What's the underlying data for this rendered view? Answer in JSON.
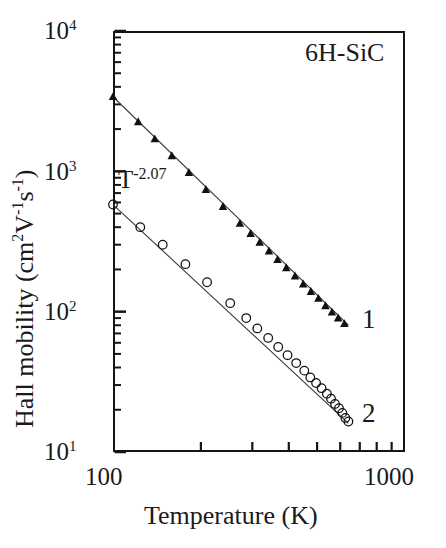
{
  "figure": {
    "sample_label": "6H-SiC",
    "annotation": {
      "base": "T",
      "exponent": "-2.07"
    }
  },
  "axes": {
    "x_title": "Temperature (K)",
    "y_title_main": "Hall mobility (cm",
    "y_title_sup1": "2",
    "y_title_mid": "V",
    "y_title_sup2": "-1",
    "y_title_mid2": "s",
    "y_title_sup3": "-1",
    "y_title_close": ")",
    "x_ticks": [
      "100",
      "1000"
    ],
    "y_ticks": [
      {
        "mantissa": "10",
        "exponent": "4"
      },
      {
        "mantissa": "10",
        "exponent": "3"
      },
      {
        "mantissa": "10",
        "exponent": "2"
      },
      {
        "mantissa": "10",
        "exponent": "1"
      }
    ]
  },
  "series_labels": {
    "one": "1",
    "two": "2"
  },
  "chart_data": {
    "type": "scatter",
    "title": "",
    "subtitle": "",
    "annotation": "T-2.07",
    "sample": "6H-SiC",
    "xlabel": "Temperature (K)",
    "ylabel": "Hall mobility (cm2V-1s-1)",
    "xscale": "log",
    "yscale": "log",
    "xlim": [
      100,
      1000
    ],
    "ylim": [
      10,
      10000
    ],
    "xticks": [
      100,
      1000
    ],
    "xminorticks": [
      200,
      300,
      400,
      500,
      600,
      700,
      800,
      900
    ],
    "yticks": [
      10,
      100,
      1000,
      10000
    ],
    "grid": false,
    "legend": "inline-labels",
    "series": [
      {
        "name": "1",
        "marker": "filled-triangle",
        "color": "#111111",
        "fit_line": {
          "slope": -2.07,
          "x": [
            100,
            640
          ],
          "y": [
            3400,
            80
          ]
        },
        "points": [
          {
            "x": 100,
            "y": 3400
          },
          {
            "x": 122,
            "y": 2250
          },
          {
            "x": 139,
            "y": 1700
          },
          {
            "x": 159,
            "y": 1290
          },
          {
            "x": 182,
            "y": 980
          },
          {
            "x": 208,
            "y": 740
          },
          {
            "x": 238,
            "y": 560
          },
          {
            "x": 272,
            "y": 425
          },
          {
            "x": 296,
            "y": 360
          },
          {
            "x": 318,
            "y": 312
          },
          {
            "x": 342,
            "y": 270
          },
          {
            "x": 366,
            "y": 235
          },
          {
            "x": 392,
            "y": 205
          },
          {
            "x": 420,
            "y": 179
          },
          {
            "x": 448,
            "y": 157
          },
          {
            "x": 476,
            "y": 139
          },
          {
            "x": 505,
            "y": 124
          },
          {
            "x": 534,
            "y": 110
          },
          {
            "x": 562,
            "y": 99
          },
          {
            "x": 590,
            "y": 90
          },
          {
            "x": 620,
            "y": 82
          }
        ]
      },
      {
        "name": "2",
        "marker": "open-circle",
        "color": "#111111",
        "fit_line": {
          "slope": -2.07,
          "x": [
            100,
            640
          ],
          "y": [
            580,
            16
          ]
        },
        "points": [
          {
            "x": 100,
            "y": 580
          },
          {
            "x": 124,
            "y": 400
          },
          {
            "x": 148,
            "y": 300
          },
          {
            "x": 177,
            "y": 218
          },
          {
            "x": 210,
            "y": 162
          },
          {
            "x": 252,
            "y": 115
          },
          {
            "x": 286,
            "y": 90
          },
          {
            "x": 312,
            "y": 76
          },
          {
            "x": 340,
            "y": 65
          },
          {
            "x": 368,
            "y": 56
          },
          {
            "x": 396,
            "y": 49
          },
          {
            "x": 424,
            "y": 43
          },
          {
            "x": 452,
            "y": 38
          },
          {
            "x": 474,
            "y": 34
          },
          {
            "x": 496,
            "y": 31
          },
          {
            "x": 518,
            "y": 28.5
          },
          {
            "x": 540,
            "y": 26
          },
          {
            "x": 558,
            "y": 24
          },
          {
            "x": 576,
            "y": 22
          },
          {
            "x": 594,
            "y": 20.5
          },
          {
            "x": 610,
            "y": 19
          },
          {
            "x": 625,
            "y": 17.5
          },
          {
            "x": 640,
            "y": 16.5
          }
        ]
      }
    ]
  }
}
